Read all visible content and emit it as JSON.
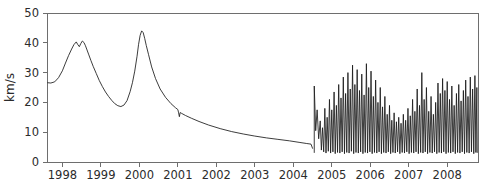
{
  "chart_data": {
    "type": "line",
    "title": "",
    "subtitle": "",
    "xlabel": "",
    "ylabel": "km/s",
    "xlim": [
      1997.6,
      2008.8
    ],
    "ylim": [
      0,
      50
    ],
    "grid": false,
    "legend": null,
    "x_ticks": [
      1998,
      1999,
      2000,
      2001,
      2002,
      2003,
      2004,
      2005,
      2006,
      2007,
      2008
    ],
    "x_tick_labels": [
      "1998",
      "1999",
      "2000",
      "2001",
      "2002",
      "2003",
      "2004",
      "2005",
      "2006",
      "2007",
      "2008"
    ],
    "y_ticks": [
      0,
      10,
      20,
      30,
      40,
      50
    ],
    "y_tick_labels": [
      "0",
      "10",
      "20",
      "30",
      "40",
      "50"
    ],
    "line_color": "#1a1a1a",
    "axis_color": "#6e6e6e",
    "background_color": "#ffffff",
    "annotations": [
      {
        "text": "smooth decaying segment 1998-mid2004"
      },
      {
        "text": "high-frequency oscillatory burst mid2004-2008"
      }
    ],
    "series": [
      {
        "name": "velocity",
        "unit": "km/s",
        "segments": [
          {
            "name": "smooth-segment",
            "x": [
              1997.62,
              1997.7,
              1997.8,
              1997.9,
              1998.0,
              1998.08,
              1998.16,
              1998.24,
              1998.3,
              1998.36,
              1998.4,
              1998.44,
              1998.48,
              1998.52,
              1998.56,
              1998.6,
              1998.64,
              1998.68,
              1998.74,
              1998.8,
              1998.88,
              1998.96,
              1999.04,
              1999.12,
              1999.2,
              1999.28,
              1999.36,
              1999.44,
              1999.52,
              1999.6,
              1999.68,
              1999.76,
              1999.82,
              1999.88,
              1999.94,
              1999.98,
              2000.02,
              2000.06,
              2000.1,
              2000.14,
              2000.18,
              2000.24,
              2000.32,
              2000.42,
              2000.54,
              2000.68,
              2000.82,
              2000.94,
              2001.0,
              2001.02,
              2001.04,
              2001.06,
              2001.1,
              2001.2,
              2001.35,
              2001.55,
              2001.8,
              2002.1,
              2002.4,
              2002.7,
              2003.0,
              2003.3,
              2003.6,
              2003.9,
              2004.15,
              2004.35,
              2004.46,
              2004.5
            ],
            "y": [
              26.6,
              26.5,
              26.9,
              28.3,
              30.6,
              33.2,
              35.7,
              37.9,
              39.4,
              40.3,
              39.4,
              38.7,
              39.8,
              40.6,
              40.1,
              39.0,
              37.6,
              36.2,
              34.1,
              32.1,
              29.7,
              27.3,
              25.3,
              23.5,
              22.0,
              20.7,
              19.6,
              18.9,
              18.6,
              19.1,
              20.6,
              23.6,
              26.6,
              30.5,
              35.5,
              39.5,
              42.5,
              44.0,
              43.4,
              41.4,
              39.1,
              36.0,
              31.9,
              28.0,
              24.5,
              21.7,
              19.6,
              18.2,
              17.6,
              16.5,
              15.2,
              16.6,
              16.3,
              15.6,
              14.7,
              13.6,
              12.4,
              11.2,
              10.2,
              9.4,
              8.7,
              8.1,
              7.6,
              7.1,
              6.6,
              6.2,
              6.0,
              4.6
            ]
          },
          {
            "name": "oscillatory-segment",
            "description": "high frequency spiky oscillation, baseline ~2-5 km/s with peaks rising from ~14 up to ~33 km/s",
            "x_start": 2004.54,
            "x_end": 2008.78,
            "spikes": [
              {
                "x": 2004.545,
                "top": 25.5,
                "bottom": 3.2
              },
              {
                "x": 2004.62,
                "top": 17.5,
                "bottom": 10.5
              },
              {
                "x": 2004.7,
                "top": 13.8,
                "bottom": 7.8
              },
              {
                "x": 2004.76,
                "top": 11.5,
                "bottom": 4.0
              },
              {
                "x": 2004.82,
                "top": 18.0,
                "bottom": 3.4
              },
              {
                "x": 2004.88,
                "top": 15.0,
                "bottom": 3.0
              },
              {
                "x": 2004.94,
                "top": 21.0,
                "bottom": 3.6
              },
              {
                "x": 2005.0,
                "top": 17.5,
                "bottom": 3.0
              },
              {
                "x": 2005.06,
                "top": 23.5,
                "bottom": 3.4
              },
              {
                "x": 2005.12,
                "top": 19.0,
                "bottom": 2.8
              },
              {
                "x": 2005.18,
                "top": 26.0,
                "bottom": 3.2
              },
              {
                "x": 2005.24,
                "top": 21.5,
                "bottom": 3.0
              },
              {
                "x": 2005.3,
                "top": 28.5,
                "bottom": 3.4
              },
              {
                "x": 2005.36,
                "top": 23.0,
                "bottom": 2.8
              },
              {
                "x": 2005.42,
                "top": 30.0,
                "bottom": 3.2
              },
              {
                "x": 2005.48,
                "top": 24.5,
                "bottom": 3.0
              },
              {
                "x": 2005.54,
                "top": 32.5,
                "bottom": 3.6
              },
              {
                "x": 2005.6,
                "top": 26.0,
                "bottom": 2.8
              },
              {
                "x": 2005.66,
                "top": 31.0,
                "bottom": 3.2
              },
              {
                "x": 2005.72,
                "top": 24.0,
                "bottom": 3.0
              },
              {
                "x": 2005.78,
                "top": 29.5,
                "bottom": 3.4
              },
              {
                "x": 2005.84,
                "top": 22.5,
                "bottom": 2.8
              },
              {
                "x": 2005.9,
                "top": 33.0,
                "bottom": 3.2
              },
              {
                "x": 2005.96,
                "top": 25.0,
                "bottom": 3.0
              },
              {
                "x": 2006.02,
                "top": 30.5,
                "bottom": 3.4
              },
              {
                "x": 2006.08,
                "top": 22.0,
                "bottom": 2.8
              },
              {
                "x": 2006.14,
                "top": 27.5,
                "bottom": 3.2
              },
              {
                "x": 2006.2,
                "top": 20.0,
                "bottom": 3.0
              },
              {
                "x": 2006.26,
                "top": 25.0,
                "bottom": 3.4
              },
              {
                "x": 2006.32,
                "top": 18.5,
                "bottom": 2.8
              },
              {
                "x": 2006.38,
                "top": 22.0,
                "bottom": 3.2
              },
              {
                "x": 2006.44,
                "top": 16.0,
                "bottom": 3.0
              },
              {
                "x": 2006.5,
                "top": 19.0,
                "bottom": 3.4
              },
              {
                "x": 2006.56,
                "top": 14.0,
                "bottom": 2.8
              },
              {
                "x": 2006.62,
                "top": 16.5,
                "bottom": 3.2
              },
              {
                "x": 2006.68,
                "top": 13.5,
                "bottom": 3.0
              },
              {
                "x": 2006.74,
                "top": 15.0,
                "bottom": 3.4
              },
              {
                "x": 2006.8,
                "top": 13.0,
                "bottom": 2.8
              },
              {
                "x": 2006.86,
                "top": 16.0,
                "bottom": 3.2
              },
              {
                "x": 2006.92,
                "top": 14.0,
                "bottom": 3.0
              },
              {
                "x": 2006.98,
                "top": 18.0,
                "bottom": 3.4
              },
              {
                "x": 2007.04,
                "top": 15.5,
                "bottom": 2.8
              },
              {
                "x": 2007.1,
                "top": 21.0,
                "bottom": 3.2
              },
              {
                "x": 2007.16,
                "top": 17.0,
                "bottom": 3.0
              },
              {
                "x": 2007.22,
                "top": 24.5,
                "bottom": 3.4
              },
              {
                "x": 2007.28,
                "top": 19.0,
                "bottom": 2.8
              },
              {
                "x": 2007.34,
                "top": 30.0,
                "bottom": 3.2
              },
              {
                "x": 2007.4,
                "top": 21.0,
                "bottom": 3.0
              },
              {
                "x": 2007.46,
                "top": 25.0,
                "bottom": 3.4
              },
              {
                "x": 2007.52,
                "top": 17.0,
                "bottom": 2.8
              },
              {
                "x": 2007.58,
                "top": 22.0,
                "bottom": 3.2
              },
              {
                "x": 2007.64,
                "top": 16.0,
                "bottom": 3.0
              },
              {
                "x": 2007.7,
                "top": 20.0,
                "bottom": 3.4
              },
              {
                "x": 2007.76,
                "top": 26.5,
                "bottom": 2.8
              },
              {
                "x": 2007.82,
                "top": 23.0,
                "bottom": 3.2
              },
              {
                "x": 2007.88,
                "top": 28.0,
                "bottom": 3.0
              },
              {
                "x": 2007.94,
                "top": 24.0,
                "bottom": 3.4
              },
              {
                "x": 2008.0,
                "top": 27.0,
                "bottom": 2.8
              },
              {
                "x": 2008.06,
                "top": 21.0,
                "bottom": 3.2
              },
              {
                "x": 2008.12,
                "top": 25.5,
                "bottom": 3.0
              },
              {
                "x": 2008.18,
                "top": 19.0,
                "bottom": 3.4
              },
              {
                "x": 2008.24,
                "top": 23.0,
                "bottom": 2.8
              },
              {
                "x": 2008.3,
                "top": 26.0,
                "bottom": 3.2
              },
              {
                "x": 2008.36,
                "top": 20.5,
                "bottom": 3.0
              },
              {
                "x": 2008.42,
                "top": 24.0,
                "bottom": 3.4
              },
              {
                "x": 2008.48,
                "top": 27.5,
                "bottom": 2.8
              },
              {
                "x": 2008.54,
                "top": 22.0,
                "bottom": 3.2
              },
              {
                "x": 2008.6,
                "top": 28.5,
                "bottom": 3.0
              },
              {
                "x": 2008.66,
                "top": 24.5,
                "bottom": 3.4
              },
              {
                "x": 2008.72,
                "top": 29.0,
                "bottom": 2.8
              },
              {
                "x": 2008.77,
                "top": 25.0,
                "bottom": 3.2
              }
            ]
          }
        ]
      }
    ]
  },
  "plot_geometry": {
    "left": 47,
    "right": 478,
    "top": 13,
    "bottom": 162
  }
}
